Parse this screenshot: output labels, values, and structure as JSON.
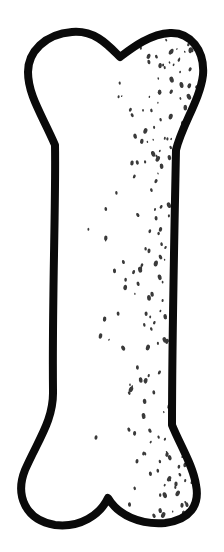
{
  "image": {
    "subject": "bone illustration",
    "description": "Black ink line drawing of a cartoon bone, vertically oriented, with stippled shading concentrated on the right side",
    "colors": {
      "background": "#ffffff",
      "outline": "#0a0a0a",
      "fill": "#ffffff",
      "stipple": "#3a3a3a"
    }
  }
}
